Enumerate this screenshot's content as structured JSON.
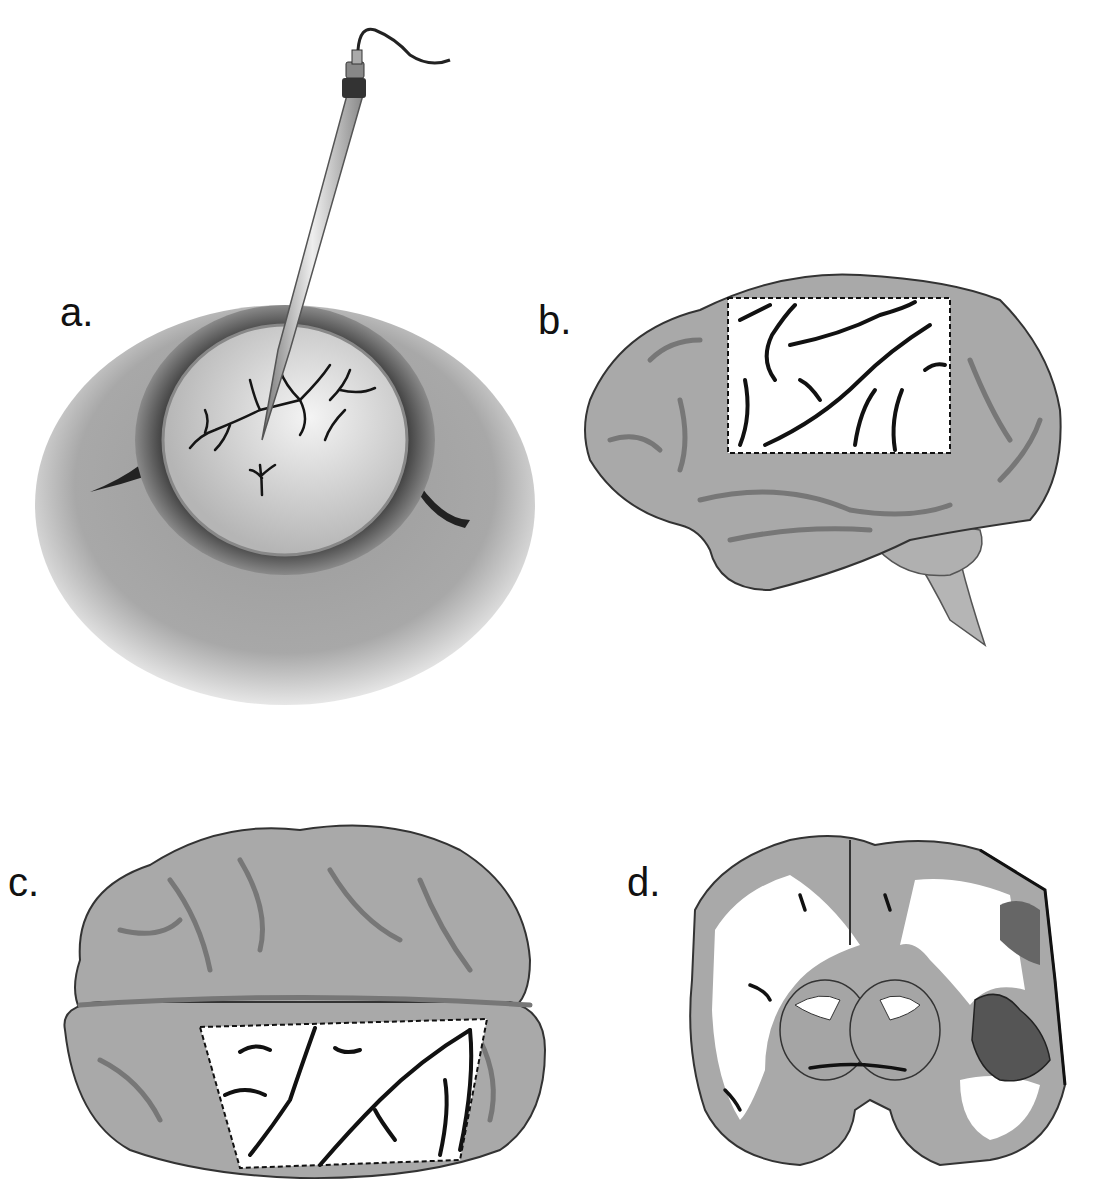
{
  "figure": {
    "panels": [
      {
        "id": "a",
        "label": "a.",
        "subject": "electrode probe inserted into exposed cortex through skull opening"
      },
      {
        "id": "b",
        "label": "b.",
        "subject": "lateral view of brain with dotted rectangular exposed region"
      },
      {
        "id": "c",
        "label": "c.",
        "subject": "top view of brain with dotted trapezoidal exposed region"
      },
      {
        "id": "d",
        "label": "d.",
        "subject": "coronal brain section with darkened lesion region on right side"
      }
    ],
    "colors": {
      "brain_fill": "#a9a9a9",
      "sulci": "#7a7a7a",
      "vessels": "#111111",
      "white_matter": "#ffffff",
      "lesion_dark": "#555555",
      "outline": "#333333"
    }
  }
}
